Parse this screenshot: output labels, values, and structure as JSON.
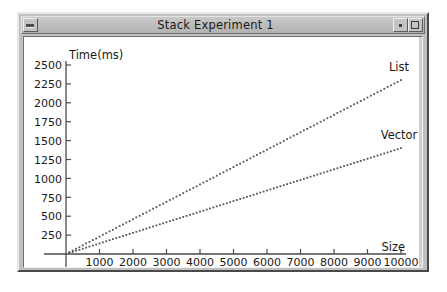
{
  "window": {
    "title": "Stack Experiment 1",
    "minimize_label": "–",
    "restore_label": "▪",
    "maximize_label": "□"
  },
  "chart_data": {
    "type": "scatter",
    "title": "",
    "xlabel": "Size",
    "ylabel": "Time(ms)",
    "xlim": [
      0,
      10400
    ],
    "ylim": [
      0,
      2500
    ],
    "grid": false,
    "legend_position": "inline-right",
    "x_ticks": [
      1000,
      2000,
      3000,
      4000,
      5000,
      6000,
      7000,
      8000,
      9000,
      10000
    ],
    "x_tick_labels": [
      "1000",
      "2000",
      "3000",
      "4000",
      "5000",
      "6000",
      "7000",
      "8000",
      "9000",
      "10000"
    ],
    "y_ticks": [
      250,
      500,
      750,
      1000,
      1250,
      1500,
      1750,
      2000,
      2250,
      2500
    ],
    "y_tick_labels": [
      "250",
      "500",
      "750",
      "1000",
      "1250",
      "1500",
      "1750",
      "2000",
      "2250",
      "2500"
    ],
    "series": [
      {
        "name": "List",
        "marker": "square",
        "color": "#555555",
        "x": [
          100,
          200,
          300,
          400,
          500,
          600,
          700,
          800,
          900,
          1000,
          1100,
          1200,
          1300,
          1400,
          1500,
          1600,
          1700,
          1800,
          1900,
          2000,
          2100,
          2200,
          2300,
          2400,
          2500,
          2600,
          2700,
          2800,
          2900,
          3000,
          3100,
          3200,
          3300,
          3400,
          3500,
          3600,
          3700,
          3800,
          3900,
          4000,
          4100,
          4200,
          4300,
          4400,
          4500,
          4600,
          4700,
          4800,
          4900,
          5000,
          5100,
          5200,
          5300,
          5400,
          5500,
          5600,
          5700,
          5800,
          5900,
          6000,
          6100,
          6200,
          6300,
          6400,
          6500,
          6600,
          6700,
          6800,
          6900,
          7000,
          7100,
          7200,
          7300,
          7400,
          7500,
          7600,
          7700,
          7800,
          7900,
          8000,
          8100,
          8200,
          8300,
          8400,
          8500,
          8600,
          8700,
          8800,
          8900,
          9000,
          9100,
          9200,
          9300,
          9400,
          9500,
          9600,
          9700,
          9800,
          9900,
          10000
        ],
        "y": [
          25,
          45,
          70,
          90,
          115,
          140,
          160,
          185,
          205,
          230,
          255,
          275,
          300,
          320,
          345,
          370,
          390,
          415,
          435,
          460,
          485,
          505,
          530,
          550,
          575,
          600,
          620,
          645,
          665,
          690,
          715,
          735,
          760,
          780,
          805,
          830,
          850,
          875,
          895,
          920,
          945,
          965,
          990,
          1010,
          1035,
          1060,
          1080,
          1105,
          1125,
          1150,
          1175,
          1195,
          1220,
          1240,
          1265,
          1290,
          1310,
          1335,
          1355,
          1380,
          1405,
          1425,
          1450,
          1470,
          1495,
          1520,
          1540,
          1565,
          1585,
          1610,
          1635,
          1655,
          1680,
          1700,
          1725,
          1750,
          1770,
          1795,
          1815,
          1840,
          1865,
          1885,
          1910,
          1930,
          1955,
          1980,
          2000,
          2025,
          2045,
          2070,
          2095,
          2115,
          2140,
          2160,
          2185,
          2210,
          2230,
          2255,
          2275,
          2300
        ]
      },
      {
        "name": "Vector",
        "marker": "square",
        "color": "#555555",
        "x": [
          100,
          200,
          300,
          400,
          500,
          600,
          700,
          800,
          900,
          1000,
          1100,
          1200,
          1300,
          1400,
          1500,
          1600,
          1700,
          1800,
          1900,
          2000,
          2100,
          2200,
          2300,
          2400,
          2500,
          2600,
          2700,
          2800,
          2900,
          3000,
          3100,
          3200,
          3300,
          3400,
          3500,
          3600,
          3700,
          3800,
          3900,
          4000,
          4100,
          4200,
          4300,
          4400,
          4500,
          4600,
          4700,
          4800,
          4900,
          5000,
          5100,
          5200,
          5300,
          5400,
          5500,
          5600,
          5700,
          5800,
          5900,
          6000,
          6100,
          6200,
          6300,
          6400,
          6500,
          6600,
          6700,
          6800,
          6900,
          7000,
          7100,
          7200,
          7300,
          7400,
          7500,
          7600,
          7700,
          7800,
          7900,
          8000,
          8100,
          8200,
          8300,
          8400,
          8500,
          8600,
          8700,
          8800,
          8900,
          9000,
          9100,
          9200,
          9300,
          9400,
          9500,
          9600,
          9700,
          9800,
          9900,
          10000
        ],
        "y": [
          15,
          28,
          42,
          55,
          70,
          84,
          98,
          112,
          126,
          140,
          154,
          168,
          182,
          196,
          210,
          224,
          238,
          252,
          266,
          280,
          294,
          308,
          322,
          336,
          350,
          364,
          378,
          392,
          406,
          420,
          434,
          448,
          462,
          476,
          490,
          504,
          518,
          532,
          546,
          560,
          574,
          588,
          602,
          616,
          630,
          644,
          658,
          672,
          686,
          700,
          714,
          728,
          742,
          756,
          770,
          784,
          798,
          812,
          826,
          840,
          854,
          868,
          882,
          896,
          910,
          924,
          938,
          952,
          966,
          980,
          994,
          1008,
          1022,
          1036,
          1050,
          1064,
          1078,
          1092,
          1106,
          1120,
          1134,
          1148,
          1162,
          1176,
          1190,
          1204,
          1218,
          1232,
          1246,
          1260,
          1274,
          1288,
          1302,
          1316,
          1330,
          1344,
          1358,
          1372,
          1386,
          1400
        ]
      }
    ]
  },
  "colors": {
    "titlebar": "#bdbdbd",
    "frame": "#c0c0c0",
    "plot_background": "#ffffff",
    "axis": "#4a4a4a",
    "marker": "#555555",
    "text": "#1a1a1a"
  }
}
